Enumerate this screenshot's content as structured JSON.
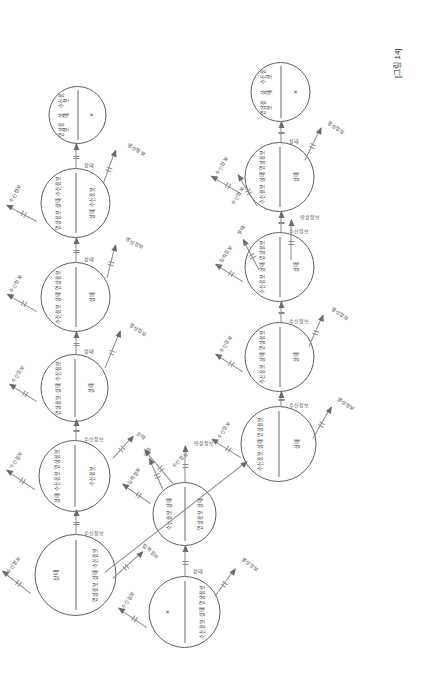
{
  "figure": {
    "caption": "[그림 14]",
    "type": "state-transition-graph",
    "orientation": "rotated-90-ccw"
  },
  "nodes": [
    {
      "id": "L1",
      "top": [
        "영상정보",
        "상태",
        "수신정보"
      ],
      "bottom": [
        "×"
      ]
    },
    {
      "id": "L2",
      "top": [
        "영상정보",
        "상태",
        "수신정보"
      ],
      "bottom": [
        "상태",
        "수신정보"
      ]
    },
    {
      "id": "L3",
      "top": [
        "수신정보",
        "상태",
        "영상정보"
      ],
      "bottom": [
        "상태"
      ]
    },
    {
      "id": "L4",
      "top": [
        "영상정보",
        "상태",
        "수신정보"
      ],
      "bottom": [
        "상태"
      ]
    },
    {
      "id": "L5",
      "top": [
        "상태",
        "수신정보",
        "영상정보"
      ],
      "bottom": [
        "수신정보"
      ]
    },
    {
      "id": "L6",
      "top": [
        "상태"
      ],
      "bottom": [
        "영상정보",
        "상태",
        "수신정보"
      ]
    },
    {
      "id": "B1",
      "top": [
        "수신정보",
        "상태"
      ],
      "bottom": [
        "영상정보",
        "상태"
      ]
    },
    {
      "id": "B2",
      "top": [
        "×"
      ],
      "bottom": [
        "수신정보",
        "상태",
        "영상정보"
      ]
    },
    {
      "id": "R1",
      "top": [
        "영상정보",
        "상태",
        "수신정보"
      ],
      "bottom": [
        "×"
      ]
    },
    {
      "id": "R2",
      "top": [
        "수신정보",
        "상태",
        "영상정보"
      ],
      "bottom": [
        "상태"
      ]
    },
    {
      "id": "R3",
      "top": [
        "수신정보",
        "상태",
        "영상정보"
      ],
      "bottom": [
        "상태"
      ]
    },
    {
      "id": "R4",
      "top": [
        "수신정보",
        "상태",
        "영상정보"
      ],
      "bottom": [
        "상태"
      ]
    },
    {
      "id": "R5",
      "top": [
        "수신정보",
        "상태",
        "영상정보"
      ],
      "bottom": [
        "상태"
      ]
    }
  ],
  "edge_labels": {
    "sangtae": "상태",
    "susin": "수신정보",
    "yeongsang": "영상정보",
    "ipryeok": "입력정보"
  },
  "colors": {
    "stroke": "#5f5f5f",
    "edge": "#8a8a8a",
    "arrow": "#6b6b6b",
    "text": "#3a3a3a",
    "background": "#ffffff"
  }
}
